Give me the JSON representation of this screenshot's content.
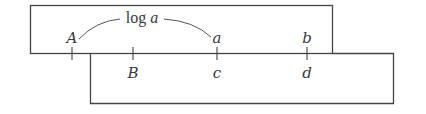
{
  "diagram": {
    "type": "slide-rule",
    "stroke_color": "#444444",
    "upper_strip": {
      "labels_above_line": [
        {
          "text": "A",
          "x": 72
        },
        {
          "text": "a",
          "x": 217
        },
        {
          "text": "b",
          "x": 307
        }
      ]
    },
    "lower_strip": {
      "labels_below_line": [
        {
          "text": "B",
          "x": 133
        },
        {
          "text": "c",
          "x": 217
        },
        {
          "text": "d",
          "x": 307
        }
      ]
    },
    "arc_label": {
      "prefix": "log ",
      "variable": "a",
      "from": "A",
      "to": "a"
    }
  }
}
